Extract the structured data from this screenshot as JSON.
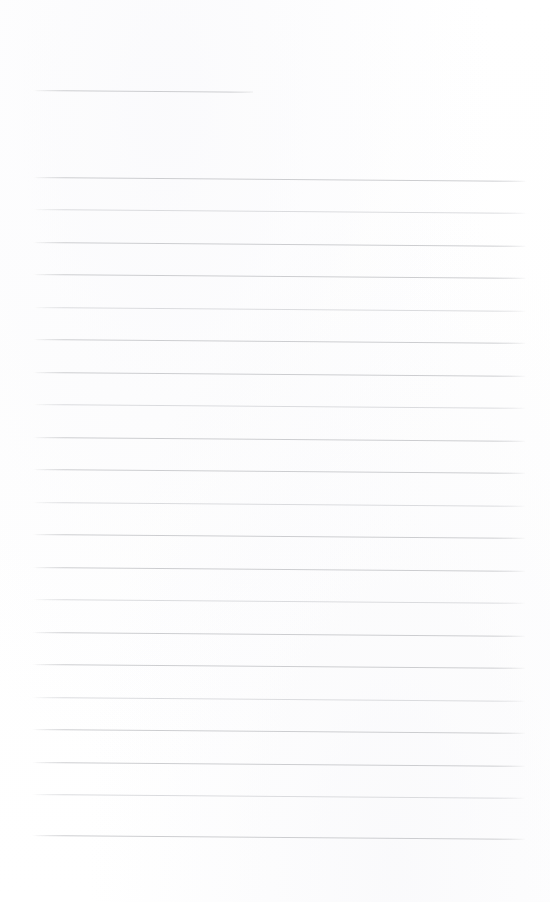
{
  "page": {
    "kind": "scanned-blank-ruled-page",
    "width": 550,
    "height": 902,
    "background_color": "#ffffff",
    "visible_text": "",
    "note": "No printed or handwritten text is visible anywhere on the page."
  },
  "ruling": {
    "line_color": "#c9cacd",
    "line_color_light": "#d8d9dc",
    "line_thickness_px": 1,
    "skew_degrees": 0.45,
    "left_margin_px": 32,
    "right_edge_px": 527,
    "body_line_spacing_px": 32.4,
    "body_line_count": 21,
    "header_line_count": 1
  },
  "header_rule": {
    "name": "header-rule",
    "x": 32,
    "y": 90,
    "width": 221
  },
  "body_rules": [
    {
      "x": 32,
      "y": 177,
      "width": 495
    },
    {
      "x": 32,
      "y": 209,
      "width": 495
    },
    {
      "x": 32,
      "y": 242,
      "width": 495
    },
    {
      "x": 32,
      "y": 274,
      "width": 495
    },
    {
      "x": 32,
      "y": 307,
      "width": 495
    },
    {
      "x": 32,
      "y": 339,
      "width": 495
    },
    {
      "x": 32,
      "y": 372,
      "width": 495
    },
    {
      "x": 32,
      "y": 404,
      "width": 495
    },
    {
      "x": 32,
      "y": 437,
      "width": 495
    },
    {
      "x": 32,
      "y": 469,
      "width": 495
    },
    {
      "x": 32,
      "y": 502,
      "width": 495
    },
    {
      "x": 32,
      "y": 534,
      "width": 495
    },
    {
      "x": 32,
      "y": 567,
      "width": 495
    },
    {
      "x": 32,
      "y": 599,
      "width": 495
    },
    {
      "x": 32,
      "y": 632,
      "width": 495
    },
    {
      "x": 32,
      "y": 664,
      "width": 495
    },
    {
      "x": 32,
      "y": 697,
      "width": 495
    },
    {
      "x": 32,
      "y": 729,
      "width": 495
    },
    {
      "x": 32,
      "y": 762,
      "width": 495
    },
    {
      "x": 32,
      "y": 794,
      "width": 495
    },
    {
      "x": 32,
      "y": 835,
      "width": 495
    }
  ],
  "regions": {
    "top_margin": {
      "name": "top-margin",
      "y": 0,
      "height": 80
    },
    "header_gap": {
      "name": "header-gap",
      "y": 100,
      "height": 70
    },
    "bottom_margin": {
      "name": "bottom-margin",
      "y": 848,
      "height": 54
    }
  }
}
